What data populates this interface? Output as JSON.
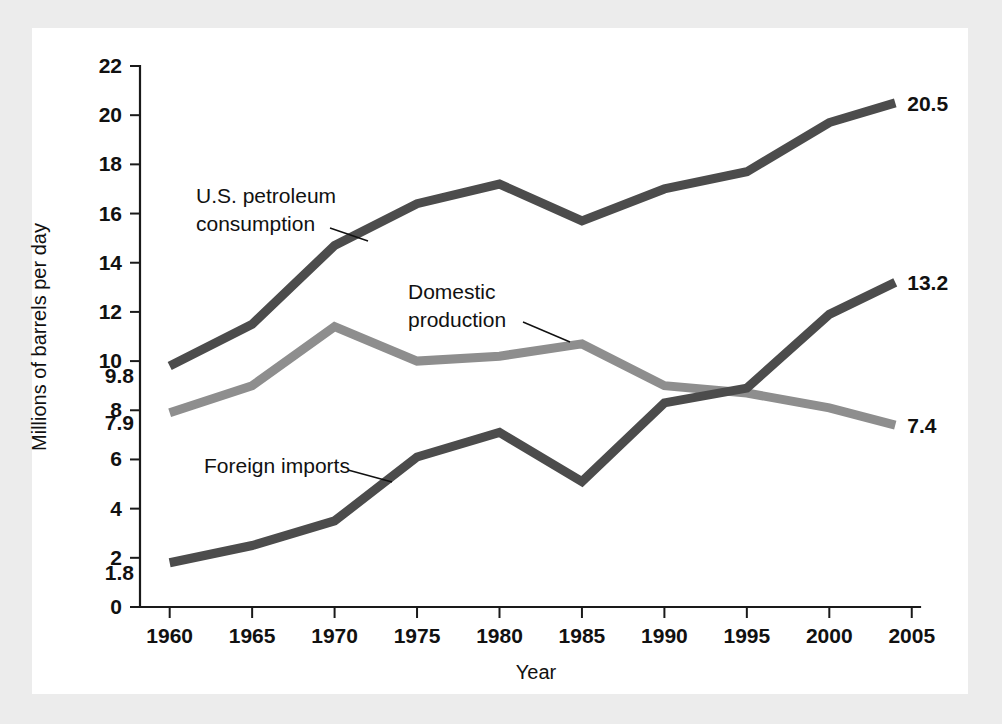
{
  "figure": {
    "panel_background": "#ffffff",
    "page_background": "#ececec"
  },
  "chart_data": {
    "type": "line",
    "title": "",
    "subtitle": "",
    "xlabel": "Year",
    "ylabel": "Millions of barrels per day",
    "x": [
      1960,
      1965,
      1970,
      1975,
      1980,
      1985,
      1990,
      1995,
      2000,
      2004
    ],
    "categories": [
      "1960",
      "1965",
      "1970",
      "1975",
      "1980",
      "1985",
      "1990",
      "1995",
      "2000",
      "2005"
    ],
    "xtick_labels": [
      "1960",
      "1965",
      "1970",
      "1975",
      "1980",
      "1985",
      "1990",
      "1995",
      "2000",
      "2005"
    ],
    "xtick_values": [
      1960,
      1965,
      1970,
      1975,
      1980,
      1985,
      1990,
      1995,
      2000,
      2005
    ],
    "ytick_labels": [
      "0",
      "2",
      "4",
      "6",
      "8",
      "10",
      "12",
      "14",
      "16",
      "18",
      "20",
      "22"
    ],
    "ytick_values": [
      0,
      2,
      4,
      6,
      8,
      10,
      12,
      14,
      16,
      18,
      20,
      22
    ],
    "xlim": [
      1958.2,
      2005.5
    ],
    "ylim": [
      0,
      22
    ],
    "grid": false,
    "legend": "none (in-plot annotations with leader lines)",
    "series": [
      {
        "name": "U.S. petroleum consumption",
        "color": "#4c4c4c",
        "values": [
          9.8,
          11.5,
          14.7,
          16.4,
          17.2,
          15.7,
          17.0,
          17.7,
          19.7,
          20.5
        ],
        "start_label": "9.8",
        "end_label": "20.5"
      },
      {
        "name": "Domestic production",
        "color": "#8e8e8e",
        "values": [
          7.9,
          9.0,
          11.4,
          10.0,
          10.2,
          10.7,
          9.0,
          8.7,
          8.1,
          7.4
        ],
        "start_label": "7.9",
        "end_label": "7.4"
      },
      {
        "name": "Foreign imports",
        "color": "#4c4c4c",
        "values": [
          1.8,
          2.5,
          3.5,
          6.1,
          7.1,
          5.1,
          8.3,
          8.9,
          11.9,
          13.2
        ],
        "start_label": "1.8",
        "end_label": "13.2"
      }
    ],
    "annotations": [
      {
        "text_line1": "U.S. petroleum",
        "text_line2": "consumption",
        "target_series": "U.S. petroleum consumption"
      },
      {
        "text_line1": "Domestic",
        "text_line2": "production",
        "target_series": "Domestic production"
      },
      {
        "text_line1": "Foreign imports",
        "text_line2": "",
        "target_series": "Foreign imports"
      }
    ]
  }
}
